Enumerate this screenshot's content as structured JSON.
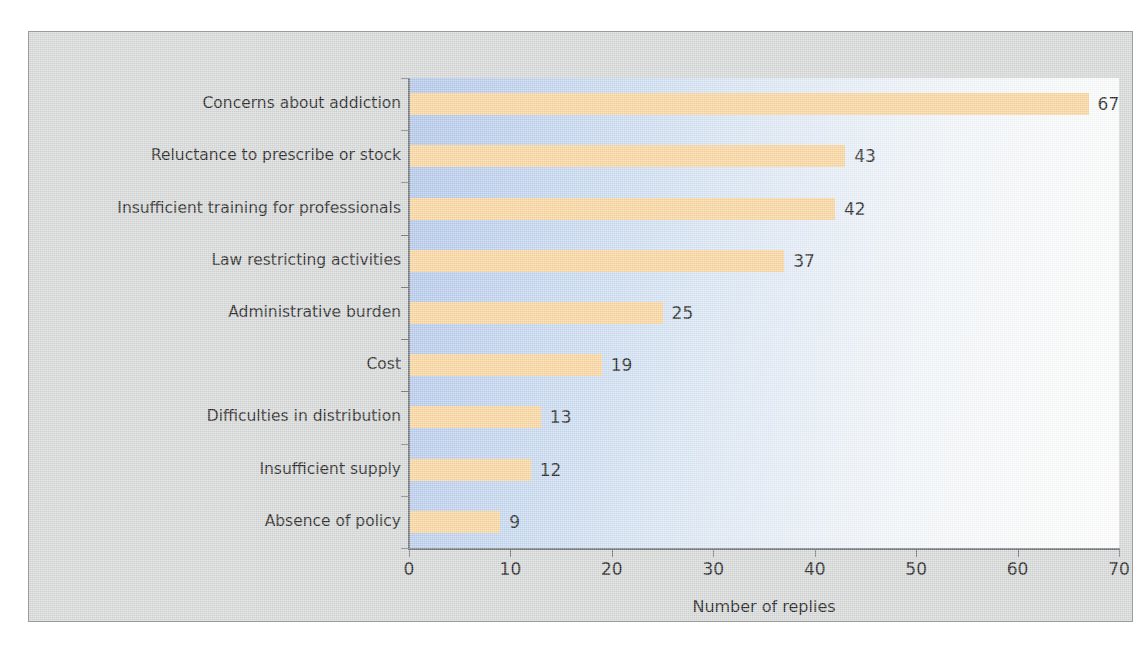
{
  "chart_data": {
    "type": "bar",
    "orientation": "horizontal",
    "title": "",
    "xlabel": "Number of replies",
    "ylabel": "",
    "categories": [
      "Concerns about addiction",
      "Reluctance to prescribe or stock",
      "Insufficient training for professionals",
      "Law restricting activities",
      "Administrative burden",
      "Cost",
      "Difficulties in distribution",
      "Insufficient supply",
      "Absence of policy"
    ],
    "values": [
      67,
      43,
      42,
      37,
      25,
      19,
      13,
      12,
      9
    ],
    "value_labels": [
      "67",
      "43",
      "42",
      "37",
      "25",
      "19",
      "13",
      "12",
      "9"
    ],
    "xlim": [
      0,
      70
    ],
    "xticks": [
      0,
      10,
      20,
      30,
      40,
      50,
      60,
      70
    ],
    "xtick_labels": [
      "0",
      "10",
      "20",
      "30",
      "40",
      "50",
      "60",
      "70"
    ],
    "grid": false,
    "legend": false,
    "bar_color": "#fad49a",
    "plot_gradient_from": "#aec4e9",
    "plot_gradient_to": "#ffffff",
    "panel_background": "#d5d7d7",
    "axis_color": "#6d7174",
    "text_color": "#161616"
  }
}
